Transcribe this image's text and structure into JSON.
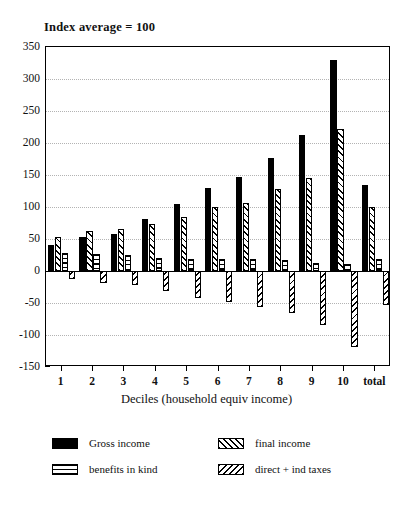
{
  "chart_data": {
    "type": "bar",
    "title": "Index average = 100",
    "xlabel": "Deciles (household equiv income)",
    "ylabel": "",
    "ylim": [
      -150,
      350
    ],
    "ytick_step": 50,
    "yticks": [
      350,
      300,
      250,
      200,
      150,
      100,
      50,
      0,
      -50,
      -100,
      -150
    ],
    "ytick_labels": [
      "350",
      "300",
      "250",
      "200",
      "150",
      "100",
      "50",
      "0",
      "-50",
      "-100",
      "-150"
    ],
    "grid": true,
    "grid_axis": "y",
    "legend_position": "below-axes",
    "categories": [
      "1",
      "2",
      "3",
      "4",
      "5",
      "6",
      "7",
      "8",
      "9",
      "10",
      "total"
    ],
    "series": [
      {
        "name": "Gross income",
        "pattern": "solid-black",
        "values": [
          41,
          53,
          58,
          81,
          105,
          130,
          147,
          176,
          213,
          330,
          134
        ]
      },
      {
        "name": "final income",
        "pattern": "backslash-hatch",
        "values": [
          53,
          62,
          65,
          73,
          85,
          100,
          106,
          128,
          146,
          222,
          100
        ]
      },
      {
        "name": "benefits in kind",
        "pattern": "horizontal-lines",
        "values": [
          28,
          27,
          25,
          20,
          19,
          18,
          18,
          17,
          13,
          11,
          19
        ]
      },
      {
        "name": "direct + ind taxes",
        "pattern": "forward-slash-hatch",
        "values": [
          -13,
          -18,
          -22,
          -32,
          -42,
          -49,
          -57,
          -66,
          -85,
          -118,
          -53
        ]
      }
    ]
  },
  "legend": {
    "items": [
      {
        "label": "Gross income",
        "pattern": "solid-black"
      },
      {
        "label": "final income",
        "pattern": "backslash-hatch"
      },
      {
        "label": "benefits in kind",
        "pattern": "horizontal-lines"
      },
      {
        "label": "direct + ind taxes",
        "pattern": "forward-slash-hatch"
      }
    ]
  }
}
